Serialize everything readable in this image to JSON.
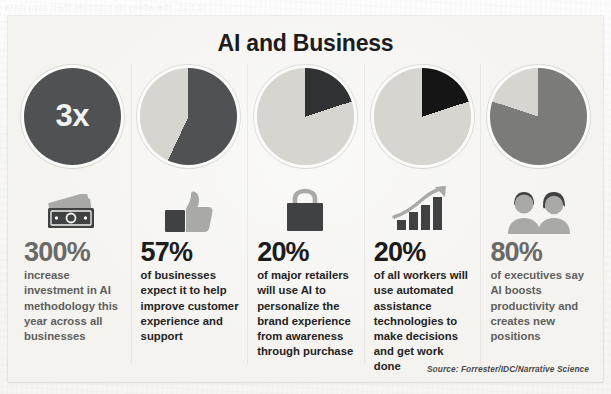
{
  "page": {
    "bleed_through": [
      {
        "text": "Offering Suggestions for Pro",
        "x": 330,
        "y": 28,
        "size": 13,
        "light": false
      },
      {
        "text": "to this, the ability to discover their own data",
        "x": 5,
        "y": 2,
        "size": 10,
        "light": true
      },
      {
        "text": "Driving Team and Segme",
        "x": 430,
        "y": 176,
        "size": 12,
        "light": false
      },
      {
        "text": "Acting as an Assistant",
        "x": 430,
        "y": 340,
        "size": 12,
        "light": false
      }
    ]
  },
  "infographic": {
    "title": "AI and Business",
    "source": "Source: Forrester/IDC/Narrative Science",
    "colors": {
      "card_background": "#f4f3f0",
      "pie_dark": "#4f5152",
      "pie_black": "#151515",
      "pie_light": "#d6d5d0",
      "pie_mid": "#7b7c7a",
      "number_grey": "#6a6a68",
      "number_dark": "#1c1c1c",
      "text_dark": "#232323",
      "icon_dark": "#3f4142",
      "icon_light": "#a9aaa7"
    },
    "columns": [
      {
        "chart": {
          "kind": "solid-circle",
          "label": "3x",
          "fill": "#4f5152"
        },
        "icon": "money-cash-icon",
        "number": "300%",
        "number_style": "grey",
        "text": "increase investment in AI methodology this year across all businesses"
      },
      {
        "chart": {
          "kind": "pie",
          "value": 57,
          "fill": "#4f5152",
          "rest": "#d6d5d0"
        },
        "icon": "thumbs-up-icon",
        "number": "57%",
        "number_style": "dark",
        "text": "of businesses expect it to help improve customer experience and support"
      },
      {
        "chart": {
          "kind": "pie",
          "value": 20,
          "fill": "#2f3132",
          "rest": "#d6d5d0"
        },
        "icon": "shopping-bag-icon",
        "number": "20%",
        "number_style": "dark",
        "text": "of major retailers will use AI to personalize the brand experience from awareness through purchase"
      },
      {
        "chart": {
          "kind": "pie",
          "value": 20,
          "fill": "#151515",
          "rest": "#d6d5d0"
        },
        "icon": "growth-chart-icon",
        "number": "20%",
        "number_style": "dark",
        "text": "of all workers will use automated assistance technologies to make decisions and get work done"
      },
      {
        "chart": {
          "kind": "pie",
          "value": 80,
          "fill": "#7b7c7a",
          "rest": "#d6d5d0"
        },
        "icon": "two-people-icon",
        "number": "80%",
        "number_style": "grey",
        "text": "of executives say AI boosts productivity and creates new positions"
      }
    ]
  },
  "chart_data": {
    "type": "pie",
    "title": "AI and Business",
    "subtitle": "",
    "legend_position": "none",
    "grid": false,
    "source": "Source: Forrester/IDC/Narrative Science",
    "charts": [
      {
        "type": "bar",
        "label": "3x",
        "categories": [
          "increase investment in AI methodology this year across all businesses"
        ],
        "values": [
          300
        ],
        "unit": "%",
        "note": "Rendered as a solid filled circle labeled 3x"
      },
      {
        "type": "pie",
        "categories": [
          "of businesses expect it to help improve customer experience and support",
          "remainder"
        ],
        "values": [
          57,
          43
        ],
        "unit": "%"
      },
      {
        "type": "pie",
        "categories": [
          "of major retailers will use AI to personalize the brand experience from awareness through purchase",
          "remainder"
        ],
        "values": [
          20,
          80
        ],
        "unit": "%"
      },
      {
        "type": "pie",
        "categories": [
          "of all workers will use automated assistance technologies to make decisions and get work done",
          "remainder"
        ],
        "values": [
          20,
          80
        ],
        "unit": "%"
      },
      {
        "type": "pie",
        "categories": [
          "of executives say AI boosts productivity and creates new positions",
          "remainder"
        ],
        "values": [
          80,
          20
        ],
        "unit": "%"
      }
    ]
  }
}
